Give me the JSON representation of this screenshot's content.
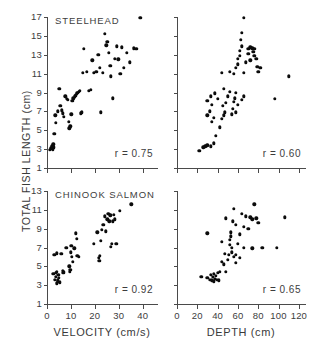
{
  "figure": {
    "y_axis_label": "TOTAL FISH LENGTH (cm)",
    "point_color": "#0b0b0b",
    "axis_color": "#4a4a4a",
    "text_color": "#3d3d3d"
  },
  "x_axes": {
    "velocity": {
      "label": "VELOCITY (cm/s)",
      "ticks": [
        0,
        10,
        20,
        30,
        40
      ],
      "tick_labels": [
        "0",
        "10",
        "20",
        "30",
        "40"
      ],
      "range": [
        0,
        46
      ]
    },
    "depth": {
      "label": "DEPTH (cm)",
      "ticks": [
        0,
        20,
        40,
        60,
        80,
        100,
        120
      ],
      "tick_labels": [
        "0",
        "20",
        "40",
        "60",
        "80",
        "100",
        "120"
      ],
      "range": [
        0,
        126
      ]
    }
  },
  "y_axes": {
    "steelhead": {
      "ticks": [
        1,
        3,
        5,
        7,
        9,
        11,
        13,
        15,
        17
      ],
      "tick_labels": [
        "1",
        "3",
        "5",
        "7",
        "9",
        "11",
        "13",
        "15",
        "17"
      ],
      "range": [
        1,
        17
      ]
    },
    "chinook": {
      "ticks": [
        1,
        3,
        5,
        7,
        9,
        11,
        13
      ],
      "tick_labels": [
        "1",
        "3",
        "5",
        "7",
        "9",
        "11",
        "13"
      ],
      "range": [
        1,
        13
      ]
    }
  },
  "chart_data": [
    {
      "id": "steelhead-velocity",
      "type": "scatter",
      "title": "STEELHEAD",
      "annotation": "r = 0.75",
      "correlation": 0.75,
      "xlabel": "VELOCITY (cm/s)",
      "ylabel": "TOTAL FISH LENGTH (cm)",
      "xlim": [
        0,
        46
      ],
      "ylim": [
        1,
        17
      ],
      "grid": false,
      "legend": "none",
      "points": [
        [
          1.2,
          2.9
        ],
        [
          1.6,
          3.1
        ],
        [
          2.1,
          3.3
        ],
        [
          2.4,
          3.0
        ],
        [
          2.6,
          3.5
        ],
        [
          2.8,
          3.2
        ],
        [
          3.1,
          4.6
        ],
        [
          3.4,
          6.6
        ],
        [
          3.8,
          5.8
        ],
        [
          4.6,
          7.0
        ],
        [
          5.2,
          9.4
        ],
        [
          5.6,
          7.6
        ],
        [
          6.2,
          7.1
        ],
        [
          6.6,
          6.8
        ],
        [
          7.0,
          6.4
        ],
        [
          7.6,
          8.6
        ],
        [
          8.2,
          8.3
        ],
        [
          8.6,
          8.2
        ],
        [
          9.2,
          5.9
        ],
        [
          9.4,
          5.2
        ],
        [
          9.8,
          5.4
        ],
        [
          10.2,
          6.7
        ],
        [
          10.6,
          8.1
        ],
        [
          11.0,
          8.4
        ],
        [
          11.6,
          8.6
        ],
        [
          12.0,
          8.7
        ],
        [
          12.4,
          8.9
        ],
        [
          12.8,
          9.0
        ],
        [
          13.2,
          9.1
        ],
        [
          13.6,
          9.2
        ],
        [
          14.2,
          6.8
        ],
        [
          14.6,
          6.9
        ],
        [
          15.0,
          11.1
        ],
        [
          15.4,
          13.6
        ],
        [
          16.6,
          11.2
        ],
        [
          17.6,
          9.2
        ],
        [
          18.2,
          9.3
        ],
        [
          19.0,
          12.4
        ],
        [
          19.6,
          11.1
        ],
        [
          20.6,
          11.2
        ],
        [
          21.4,
          13.0
        ],
        [
          22.0,
          11.6
        ],
        [
          22.6,
          6.9
        ],
        [
          23.4,
          11.1
        ],
        [
          24.2,
          15.2
        ],
        [
          24.8,
          14.0
        ],
        [
          25.2,
          14.4
        ],
        [
          25.8,
          13.2
        ],
        [
          26.4,
          11.8
        ],
        [
          26.8,
          10.7
        ],
        [
          27.4,
          8.4
        ],
        [
          28.4,
          12.6
        ],
        [
          29.2,
          13.9
        ],
        [
          29.8,
          12.5
        ],
        [
          30.6,
          11.0
        ],
        [
          31.4,
          13.8
        ],
        [
          32.0,
          11.6
        ],
        [
          33.4,
          13.2
        ],
        [
          34.6,
          12.2
        ],
        [
          36.2,
          13.7
        ],
        [
          37.4,
          13.6
        ],
        [
          39.0,
          16.9
        ]
      ]
    },
    {
      "id": "steelhead-depth",
      "type": "scatter",
      "title": "",
      "annotation": "r = 0.60",
      "correlation": 0.6,
      "xlabel": "DEPTH (cm)",
      "ylabel": "TOTAL FISH LENGTH (cm)",
      "xlim": [
        0,
        126
      ],
      "ylim": [
        1,
        17
      ],
      "grid": false,
      "legend": "none",
      "points": [
        [
          22,
          2.8
        ],
        [
          26,
          3.2
        ],
        [
          28,
          3.3
        ],
        [
          30,
          3.4
        ],
        [
          33,
          3.3
        ],
        [
          36,
          3.6
        ],
        [
          38,
          4.4
        ],
        [
          34,
          5.9
        ],
        [
          36,
          6.3
        ],
        [
          30,
          6.6
        ],
        [
          32,
          7.0
        ],
        [
          34,
          7.7
        ],
        [
          30,
          8.1
        ],
        [
          33,
          8.6
        ],
        [
          37,
          8.9
        ],
        [
          40,
          8.3
        ],
        [
          42,
          5.3
        ],
        [
          44,
          6.2
        ],
        [
          46,
          6.6
        ],
        [
          47,
          6.9
        ],
        [
          45,
          7.6
        ],
        [
          48,
          7.9
        ],
        [
          50,
          8.6
        ],
        [
          52,
          9.1
        ],
        [
          46,
          9.4
        ],
        [
          44,
          11.1
        ],
        [
          54,
          6.7
        ],
        [
          55,
          7.3
        ],
        [
          56,
          8.0
        ],
        [
          57,
          8.4
        ],
        [
          58,
          9.0
        ],
        [
          56,
          11.0
        ],
        [
          58,
          11.6
        ],
        [
          60,
          12.0
        ],
        [
          60,
          12.6
        ],
        [
          62,
          12.9
        ],
        [
          62,
          13.4
        ],
        [
          64,
          13.9
        ],
        [
          63,
          14.6
        ],
        [
          64,
          15.3
        ],
        [
          66,
          16.9
        ],
        [
          66,
          11.1
        ],
        [
          68,
          12.2
        ],
        [
          70,
          13.1
        ],
        [
          70,
          13.6
        ],
        [
          72,
          13.8
        ],
        [
          72,
          12.4
        ],
        [
          74,
          13.7
        ],
        [
          75,
          13.3
        ],
        [
          76,
          12.9
        ],
        [
          76,
          13.6
        ],
        [
          78,
          12.6
        ],
        [
          79,
          11.7
        ],
        [
          80,
          11.2
        ],
        [
          82,
          11.6
        ],
        [
          60,
          7.7
        ],
        [
          64,
          8.2
        ],
        [
          66,
          8.6
        ],
        [
          52,
          11.2
        ],
        [
          58,
          6.9
        ],
        [
          96,
          8.3
        ],
        [
          110,
          10.7
        ]
      ]
    },
    {
      "id": "chinook-velocity",
      "type": "scatter",
      "title": "CHINOOK SALMON",
      "annotation": "r = 0.92",
      "correlation": 0.92,
      "xlabel": "VELOCITY (cm/s)",
      "ylabel": "TOTAL FISH LENGTH (cm)",
      "xlim": [
        0,
        46
      ],
      "ylim": [
        1,
        13
      ],
      "grid": false,
      "legend": "none",
      "points": [
        [
          2.6,
          4.2
        ],
        [
          3.2,
          3.6
        ],
        [
          3.6,
          4.3
        ],
        [
          3.8,
          3.9
        ],
        [
          4.0,
          3.2
        ],
        [
          4.2,
          4.4
        ],
        [
          4.4,
          3.6
        ],
        [
          4.6,
          3.4
        ],
        [
          4.8,
          4.1
        ],
        [
          5.0,
          3.8
        ],
        [
          5.4,
          3.3
        ],
        [
          3.0,
          6.2
        ],
        [
          4.2,
          6.4
        ],
        [
          6.0,
          6.3
        ],
        [
          6.6,
          4.5
        ],
        [
          6.8,
          4.3
        ],
        [
          7.0,
          4.4
        ],
        [
          8.0,
          7.0
        ],
        [
          9.4,
          5.0
        ],
        [
          9.6,
          4.4
        ],
        [
          9.8,
          4.6
        ],
        [
          10.0,
          6.5
        ],
        [
          10.2,
          7.2
        ],
        [
          10.4,
          6.0
        ],
        [
          10.8,
          5.5
        ],
        [
          11.4,
          6.9
        ],
        [
          12.0,
          8.5
        ],
        [
          12.4,
          7.9
        ],
        [
          12.6,
          6.1
        ],
        [
          13.2,
          6.0
        ],
        [
          19.6,
          7.4
        ],
        [
          21.0,
          8.6
        ],
        [
          21.6,
          5.9
        ],
        [
          21.8,
          5.6
        ],
        [
          22.2,
          6.1
        ],
        [
          22.6,
          7.7
        ],
        [
          23.0,
          8.9
        ],
        [
          23.6,
          9.4
        ],
        [
          24.2,
          10.3
        ],
        [
          24.6,
          8.7
        ],
        [
          25.2,
          10.0
        ],
        [
          25.6,
          10.6
        ],
        [
          26.0,
          9.8
        ],
        [
          26.4,
          10.4
        ],
        [
          26.8,
          7.1
        ],
        [
          27.2,
          7.4
        ],
        [
          27.6,
          9.8
        ],
        [
          28.0,
          10.5
        ],
        [
          28.4,
          10.0
        ],
        [
          29.0,
          7.4
        ],
        [
          30.4,
          10.9
        ],
        [
          35.2,
          11.6
        ]
      ]
    },
    {
      "id": "chinook-depth",
      "type": "scatter",
      "title": "",
      "annotation": "r = 0.65",
      "correlation": 0.65,
      "xlabel": "DEPTH (cm)",
      "ylabel": "TOTAL FISH LENGTH (cm)",
      "xlim": [
        0,
        126
      ],
      "ylim": [
        1,
        13
      ],
      "grid": false,
      "legend": "none",
      "points": [
        [
          24,
          3.9
        ],
        [
          30,
          3.8
        ],
        [
          32,
          3.6
        ],
        [
          33,
          4.1
        ],
        [
          34,
          3.5
        ],
        [
          35,
          3.9
        ],
        [
          36,
          4.2
        ],
        [
          36,
          3.4
        ],
        [
          37,
          3.7
        ],
        [
          38,
          4.0
        ],
        [
          39,
          3.6
        ],
        [
          40,
          4.3
        ],
        [
          41,
          3.5
        ],
        [
          42,
          4.4
        ],
        [
          30,
          8.5
        ],
        [
          44,
          5.5
        ],
        [
          46,
          5.2
        ],
        [
          47,
          6.3
        ],
        [
          48,
          4.4
        ],
        [
          50,
          5.7
        ],
        [
          51,
          6.2
        ],
        [
          52,
          7.3
        ],
        [
          52,
          7.8
        ],
        [
          53,
          8.2
        ],
        [
          53,
          8.6
        ],
        [
          54,
          7.0
        ],
        [
          54,
          6.5
        ],
        [
          55,
          9.8
        ],
        [
          56,
          6.0
        ],
        [
          58,
          6.2
        ],
        [
          60,
          7.4
        ],
        [
          58,
          5.4
        ],
        [
          62,
          8.4
        ],
        [
          64,
          10.6
        ],
        [
          66,
          9.2
        ],
        [
          68,
          10.3
        ],
        [
          70,
          9.0
        ],
        [
          72,
          10.2
        ],
        [
          74,
          10.0
        ],
        [
          76,
          11.6
        ],
        [
          78,
          10.1
        ],
        [
          80,
          9.6
        ],
        [
          66,
          7.0
        ],
        [
          74,
          6.9
        ],
        [
          84,
          7.0
        ],
        [
          98,
          7.0
        ],
        [
          106,
          10.2
        ],
        [
          44,
          7.6
        ],
        [
          56,
          11.1
        ],
        [
          48,
          10.1
        ],
        [
          62,
          5.9
        ],
        [
          58,
          9.4
        ]
      ]
    }
  ]
}
